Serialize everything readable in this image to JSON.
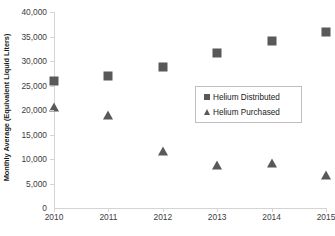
{
  "chart_data": {
    "type": "scatter",
    "title": "",
    "xlabel": "",
    "ylabel": "Monthly Average (Equivalent Liquid Liters)",
    "categories": [
      "2010",
      "2011",
      "2012",
      "2013",
      "2014",
      "2015"
    ],
    "x": [
      2010,
      2011,
      2012,
      2013,
      2014,
      2015
    ],
    "series": [
      {
        "name": "Helium Distributed",
        "marker": "square",
        "color": "#595959",
        "values": [
          26000,
          27000,
          28800,
          31600,
          34100,
          36000
        ]
      },
      {
        "name": "Helium Purchased",
        "marker": "triangle",
        "color": "#595959",
        "values": [
          20600,
          19000,
          11600,
          8700,
          9200,
          6800
        ]
      }
    ],
    "ylim": [
      0,
      40000
    ],
    "y_ticks": [
      0,
      5000,
      10000,
      15000,
      20000,
      25000,
      30000,
      35000,
      40000
    ],
    "y_tick_labels": [
      "0",
      "5,000",
      "10,000",
      "15,000",
      "20,000",
      "25,000",
      "30,000",
      "35,000",
      "40,000"
    ],
    "x_tick_labels": [
      "2010",
      "2011",
      "2012",
      "2013",
      "2014",
      "2015"
    ],
    "grid": false,
    "legend_position": "center-right",
    "axis_color": "#d4d4d4"
  }
}
